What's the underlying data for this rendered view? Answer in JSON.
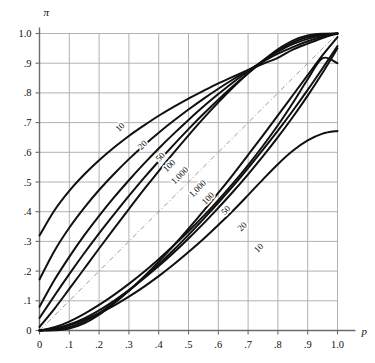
{
  "chart_data": {
    "type": "line",
    "title": "",
    "subtitle": "",
    "xlabel": "p",
    "ylabel": "π",
    "xlim": [
      0,
      1
    ],
    "ylim": [
      0,
      1
    ],
    "grid": true,
    "legend": "inline-curve-labels",
    "x_ticks": [
      "0",
      ".1",
      ".2",
      ".3",
      ".4",
      ".5",
      ".6",
      ".7",
      ".8",
      ".9",
      "1.0"
    ],
    "x_tick_values": [
      0,
      0.1,
      0.2,
      0.3,
      0.4,
      0.5,
      0.6,
      0.7,
      0.8,
      0.9,
      1.0
    ],
    "y_ticks": [
      "0",
      ".1",
      ".2",
      ".3",
      ".4",
      ".5",
      ".6",
      ".7",
      ".8",
      ".9",
      "1.0"
    ],
    "y_tick_values": [
      0,
      0.1,
      0.2,
      0.3,
      0.4,
      0.5,
      0.6,
      0.7,
      0.8,
      0.9,
      1.0
    ],
    "reference_line": {
      "name": "diagonal",
      "style": "dash-dot",
      "x": [
        0,
        1
      ],
      "y": [
        0,
        1
      ]
    },
    "series": [
      {
        "name": "upper-10",
        "label": "10",
        "branch": "upper",
        "n": 10,
        "label_x": 0.27,
        "label_y": 0.685,
        "x": [
          0.0,
          0.05,
          0.1,
          0.15,
          0.2,
          0.25,
          0.3,
          0.35,
          0.4,
          0.45,
          0.5,
          0.55,
          0.6,
          0.65,
          0.7,
          0.75,
          0.8,
          0.85,
          0.9,
          0.95,
          1.0
        ],
        "y": [
          0.32,
          0.404,
          0.47,
          0.525,
          0.573,
          0.616,
          0.655,
          0.69,
          0.723,
          0.753,
          0.781,
          0.807,
          0.832,
          0.855,
          0.877,
          0.898,
          0.918,
          0.946,
          0.966,
          0.985,
          1.0
        ]
      },
      {
        "name": "upper-20",
        "label": "20",
        "branch": "upper",
        "n": 20,
        "label_x": 0.345,
        "label_y": 0.625,
        "x": [
          0.0,
          0.05,
          0.1,
          0.15,
          0.2,
          0.25,
          0.3,
          0.35,
          0.4,
          0.45,
          0.5,
          0.55,
          0.6,
          0.65,
          0.7,
          0.75,
          0.8,
          0.85,
          0.9,
          0.95,
          1.0
        ],
        "y": [
          0.172,
          0.268,
          0.346,
          0.413,
          0.473,
          0.527,
          0.577,
          0.623,
          0.666,
          0.706,
          0.744,
          0.78,
          0.814,
          0.846,
          0.876,
          0.905,
          0.932,
          0.954,
          0.974,
          0.989,
          1.0
        ]
      },
      {
        "name": "upper-50",
        "label": "50",
        "branch": "upper",
        "n": 50,
        "label_x": 0.405,
        "label_y": 0.585,
        "x": [
          0.0,
          0.05,
          0.1,
          0.15,
          0.2,
          0.25,
          0.3,
          0.35,
          0.4,
          0.45,
          0.5,
          0.55,
          0.6,
          0.65,
          0.7,
          0.75,
          0.8,
          0.85,
          0.9,
          0.95,
          1.0
        ],
        "y": [
          0.08,
          0.17,
          0.248,
          0.32,
          0.386,
          0.448,
          0.506,
          0.561,
          0.613,
          0.662,
          0.709,
          0.754,
          0.796,
          0.836,
          0.873,
          0.908,
          0.939,
          0.964,
          0.982,
          0.994,
          1.0
        ]
      },
      {
        "name": "upper-100",
        "label": "100",
        "branch": "upper",
        "n": 100,
        "label_x": 0.435,
        "label_y": 0.555,
        "x": [
          0.0,
          0.05,
          0.1,
          0.15,
          0.2,
          0.25,
          0.3,
          0.35,
          0.4,
          0.45,
          0.5,
          0.55,
          0.6,
          0.65,
          0.7,
          0.75,
          0.8,
          0.85,
          0.9,
          0.95,
          1.0
        ],
        "y": [
          0.042,
          0.117,
          0.19,
          0.26,
          0.327,
          0.391,
          0.453,
          0.513,
          0.57,
          0.625,
          0.678,
          0.729,
          0.777,
          0.823,
          0.866,
          0.906,
          0.942,
          0.97,
          0.988,
          0.997,
          1.0
        ]
      },
      {
        "name": "upper-1000",
        "label": "1,000",
        "branch": "upper",
        "n": 1000,
        "label_x": 0.47,
        "label_y": 0.522,
        "x": [
          0.0,
          0.05,
          0.1,
          0.15,
          0.2,
          0.25,
          0.3,
          0.35,
          0.4,
          0.45,
          0.5,
          0.55,
          0.6,
          0.65,
          0.7,
          0.75,
          0.8,
          0.85,
          0.9,
          0.95,
          1.0
        ],
        "y": [
          0.012,
          0.073,
          0.14,
          0.208,
          0.276,
          0.343,
          0.409,
          0.474,
          0.537,
          0.598,
          0.657,
          0.714,
          0.768,
          0.819,
          0.866,
          0.909,
          0.947,
          0.976,
          0.993,
          0.999,
          1.0
        ]
      },
      {
        "name": "lower-1000",
        "label": "1,000",
        "branch": "lower",
        "n": 1000,
        "label_x": 0.53,
        "label_y": 0.478,
        "x": [
          0.0,
          0.05,
          0.1,
          0.15,
          0.2,
          0.25,
          0.3,
          0.35,
          0.4,
          0.45,
          0.5,
          0.55,
          0.6,
          0.65,
          0.7,
          0.75,
          0.8,
          0.85,
          0.9,
          0.95,
          1.0
        ],
        "y": [
          0.0,
          0.001,
          0.007,
          0.024,
          0.053,
          0.091,
          0.134,
          0.181,
          0.232,
          0.286,
          0.343,
          0.402,
          0.463,
          0.526,
          0.591,
          0.657,
          0.724,
          0.792,
          0.86,
          0.927,
          0.988
        ]
      },
      {
        "name": "lower-100",
        "label": "100",
        "branch": "lower",
        "n": 100,
        "label_x": 0.565,
        "label_y": 0.445,
        "x": [
          0.0,
          0.05,
          0.1,
          0.15,
          0.2,
          0.25,
          0.3,
          0.35,
          0.4,
          0.45,
          0.5,
          0.55,
          0.6,
          0.65,
          0.7,
          0.75,
          0.8,
          0.85,
          0.9,
          0.95,
          1.0
        ],
        "y": [
          0.0,
          0.003,
          0.012,
          0.03,
          0.058,
          0.094,
          0.134,
          0.177,
          0.223,
          0.271,
          0.322,
          0.375,
          0.43,
          0.487,
          0.547,
          0.609,
          0.673,
          0.74,
          0.81,
          0.883,
          0.958
        ]
      },
      {
        "name": "lower-50",
        "label": "50",
        "branch": "lower",
        "n": 50,
        "label_x": 0.625,
        "label_y": 0.405,
        "x": [
          0.0,
          0.05,
          0.1,
          0.15,
          0.2,
          0.25,
          0.3,
          0.35,
          0.4,
          0.45,
          0.5,
          0.55,
          0.6,
          0.65,
          0.7,
          0.75,
          0.8,
          0.85,
          0.9,
          0.95,
          1.0
        ],
        "y": [
          0.0,
          0.006,
          0.02,
          0.041,
          0.068,
          0.1,
          0.136,
          0.175,
          0.217,
          0.262,
          0.31,
          0.36,
          0.413,
          0.468,
          0.526,
          0.587,
          0.651,
          0.719,
          0.791,
          0.868,
          0.95
        ]
      },
      {
        "name": "lower-20",
        "label": "20",
        "branch": "lower",
        "n": 20,
        "label_x": 0.68,
        "label_y": 0.35,
        "x": [
          0.0,
          0.05,
          0.1,
          0.15,
          0.2,
          0.25,
          0.3,
          0.35,
          0.4,
          0.45,
          0.5,
          0.55,
          0.6,
          0.65,
          0.7,
          0.75,
          0.8,
          0.85,
          0.9,
          0.95,
          1.0
        ],
        "y": [
          0.0,
          0.011,
          0.03,
          0.056,
          0.086,
          0.12,
          0.157,
          0.197,
          0.24,
          0.286,
          0.334,
          0.385,
          0.439,
          0.496,
          0.557,
          0.622,
          0.691,
          0.766,
          0.846,
          0.917,
          0.9
        ]
      },
      {
        "name": "lower-10",
        "label": "10",
        "branch": "lower",
        "n": 10,
        "label_x": 0.735,
        "label_y": 0.278,
        "x": [
          0.0,
          0.05,
          0.1,
          0.15,
          0.2,
          0.25,
          0.3,
          0.35,
          0.4,
          0.45,
          0.5,
          0.55,
          0.6,
          0.65,
          0.7,
          0.75,
          0.8,
          0.85,
          0.9,
          0.95,
          1.0
        ],
        "y": [
          0.0,
          0.006,
          0.018,
          0.036,
          0.058,
          0.084,
          0.114,
          0.147,
          0.183,
          0.222,
          0.264,
          0.308,
          0.355,
          0.404,
          0.456,
          0.509,
          0.56,
          0.605,
          0.64,
          0.663,
          0.672
        ]
      }
    ],
    "colors": {
      "curve": "#101010",
      "grid": "#a8a8a8",
      "axis": "#6b6b6b",
      "text": "#111111",
      "background": "#ffffff"
    }
  }
}
